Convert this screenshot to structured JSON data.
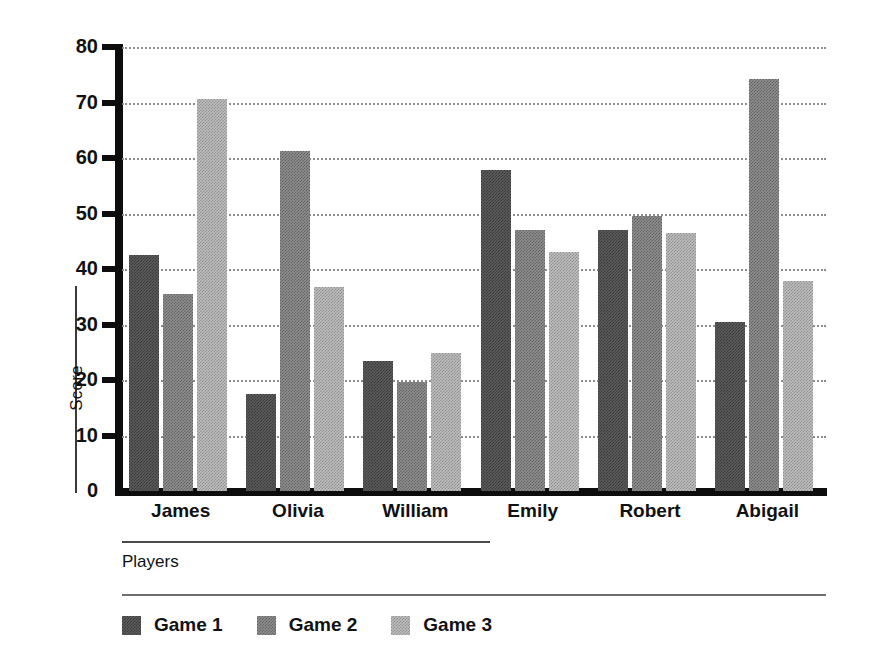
{
  "chart_data": {
    "type": "bar",
    "title": "",
    "xlabel": "Players",
    "ylabel": "Score",
    "categories": [
      "James",
      "Olivia",
      "William",
      "Emily",
      "Robert",
      "Abigail"
    ],
    "series": [
      {
        "name": "Game 1",
        "color": "#5b5b5b",
        "values": [
          42.5,
          17.5,
          23.5,
          57.8,
          47.0,
          30.5
        ]
      },
      {
        "name": "Game 2",
        "color": "#8e8e8e",
        "values": [
          35.5,
          61.3,
          19.7,
          47.0,
          49.5,
          74.3
        ]
      },
      {
        "name": "Game 3",
        "color": "#bdbdbd",
        "values": [
          70.7,
          36.8,
          24.9,
          43.0,
          46.5,
          37.8
        ]
      }
    ],
    "ylim": [
      0,
      80
    ],
    "yticks": [
      0,
      10,
      20,
      30,
      40,
      50,
      60,
      70,
      80
    ],
    "ytick_labels": [
      "0",
      "10",
      "20",
      "30",
      "40",
      "50",
      "60",
      "70",
      "80"
    ],
    "grid": true,
    "grid_style": "dotted",
    "legend_position": "bottom-left",
    "background": "#ffffff",
    "axis_color": "#0d0d0d"
  }
}
